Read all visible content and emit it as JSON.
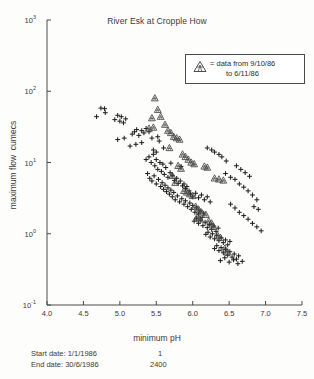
{
  "chart_data": {
    "type": "scatter",
    "title": "River Esk at Cropple How",
    "xlabel": "minimum pH",
    "ylabel": "maximum flow  cumecs",
    "xlim": [
      4.0,
      7.5
    ],
    "ylim": [
      0.1,
      1000
    ],
    "yscale": "log",
    "xscale": "linear",
    "grid": false,
    "xticks": [
      "4.0",
      "4.5",
      "5.0",
      "5.5",
      "6.0",
      "6.5",
      "7.0",
      "7.5"
    ],
    "xtick_values": [
      4.0,
      4.5,
      5.0,
      5.5,
      6.0,
      6.5,
      7.0,
      7.5
    ],
    "yticks": [
      "10",
      "10",
      "10",
      "10",
      "10"
    ],
    "ytick_exponents": [
      "3",
      "2",
      "1",
      "0",
      "-1"
    ],
    "ytick_values": [
      1000,
      100,
      10,
      1,
      0.1
    ],
    "legend": {
      "position": "upper-right-inset",
      "marker": "triangle",
      "line1": "= data from 9/10/86",
      "line2": "to 6/11/86"
    },
    "series": [
      {
        "name": "all data",
        "marker": "plus",
        "color": "#222222",
        "points": [
          [
            4.68,
            44
          ],
          [
            4.74,
            58
          ],
          [
            4.79,
            57
          ],
          [
            4.8,
            50
          ],
          [
            4.93,
            40
          ],
          [
            4.97,
            46
          ],
          [
            5.0,
            38
          ],
          [
            5.02,
            44
          ],
          [
            5.05,
            36
          ],
          [
            5.08,
            41
          ],
          [
            4.97,
            21
          ],
          [
            5.06,
            22
          ],
          [
            5.17,
            25
          ],
          [
            5.2,
            27
          ],
          [
            5.23,
            29
          ],
          [
            5.26,
            24
          ],
          [
            5.3,
            28
          ],
          [
            5.33,
            26
          ],
          [
            5.36,
            30
          ],
          [
            5.4,
            27
          ],
          [
            5.44,
            22
          ],
          [
            5.22,
            18
          ],
          [
            5.52,
            23
          ],
          [
            5.36,
            11
          ],
          [
            5.4,
            12
          ],
          [
            5.43,
            10
          ],
          [
            5.46,
            13
          ],
          [
            5.48,
            9.0
          ],
          [
            5.5,
            11
          ],
          [
            5.52,
            8.0
          ],
          [
            5.55,
            10
          ],
          [
            5.57,
            7.5
          ],
          [
            5.59,
            9.5
          ],
          [
            5.61,
            6.8
          ],
          [
            5.63,
            8.5
          ],
          [
            5.38,
            7.0
          ],
          [
            5.41,
            6.0
          ],
          [
            5.44,
            5.5
          ],
          [
            5.47,
            6.5
          ],
          [
            5.5,
            5.0
          ],
          [
            5.53,
            5.8
          ],
          [
            5.56,
            4.6
          ],
          [
            5.58,
            5.2
          ],
          [
            5.6,
            4.2
          ],
          [
            5.62,
            4.8
          ],
          [
            5.64,
            3.9
          ],
          [
            5.66,
            4.4
          ],
          [
            5.68,
            3.6
          ],
          [
            5.7,
            4.1
          ],
          [
            5.72,
            3.3
          ],
          [
            5.74,
            3.8
          ],
          [
            5.66,
            6.2
          ],
          [
            5.69,
            7.2
          ],
          [
            5.72,
            6.6
          ],
          [
            5.75,
            5.6
          ],
          [
            5.78,
            6.0
          ],
          [
            5.8,
            5.1
          ],
          [
            5.83,
            5.5
          ],
          [
            5.86,
            4.7
          ],
          [
            5.88,
            5.0
          ],
          [
            5.9,
            4.3
          ],
          [
            5.92,
            4.6
          ],
          [
            5.95,
            4.0
          ],
          [
            5.76,
            3.0
          ],
          [
            5.79,
            3.4
          ],
          [
            5.82,
            2.8
          ],
          [
            5.85,
            3.1
          ],
          [
            5.88,
            2.6
          ],
          [
            5.9,
            2.9
          ],
          [
            5.93,
            2.4
          ],
          [
            5.96,
            2.7
          ],
          [
            5.98,
            2.2
          ],
          [
            6.0,
            2.5
          ],
          [
            6.03,
            2.0
          ],
          [
            6.05,
            2.3
          ],
          [
            6.08,
            1.9
          ],
          [
            6.1,
            2.1
          ],
          [
            6.13,
            1.7
          ],
          [
            6.15,
            1.95
          ],
          [
            5.97,
            3.6
          ],
          [
            6.0,
            3.3
          ],
          [
            6.04,
            3.7
          ],
          [
            6.08,
            3.2
          ],
          [
            6.12,
            3.5
          ],
          [
            6.16,
            3.0
          ],
          [
            6.2,
            3.3
          ],
          [
            6.24,
            2.8
          ],
          [
            6.02,
            1.5
          ],
          [
            6.05,
            1.65
          ],
          [
            6.08,
            1.4
          ],
          [
            6.11,
            1.55
          ],
          [
            6.14,
            1.3
          ],
          [
            6.17,
            1.45
          ],
          [
            6.2,
            1.22
          ],
          [
            6.23,
            1.35
          ],
          [
            6.26,
            1.15
          ],
          [
            6.29,
            1.28
          ],
          [
            6.32,
            1.08
          ],
          [
            6.35,
            1.2
          ],
          [
            6.18,
            0.98
          ],
          [
            6.21,
            1.05
          ],
          [
            6.24,
            0.9
          ],
          [
            6.27,
            1.0
          ],
          [
            6.3,
            0.85
          ],
          [
            6.33,
            0.95
          ],
          [
            6.36,
            0.8
          ],
          [
            6.39,
            0.88
          ],
          [
            6.42,
            0.75
          ],
          [
            6.45,
            0.82
          ],
          [
            6.48,
            0.7
          ],
          [
            6.51,
            0.78
          ],
          [
            6.3,
            0.62
          ],
          [
            6.33,
            0.68
          ],
          [
            6.36,
            0.58
          ],
          [
            6.39,
            0.64
          ],
          [
            6.42,
            0.54
          ],
          [
            6.45,
            0.6
          ],
          [
            6.48,
            0.5
          ],
          [
            6.51,
            0.56
          ],
          [
            6.54,
            0.47
          ],
          [
            6.57,
            0.52
          ],
          [
            6.6,
            0.44
          ],
          [
            6.63,
            0.49
          ],
          [
            6.38,
            0.42
          ],
          [
            6.44,
            0.46
          ],
          [
            6.5,
            0.4
          ],
          [
            6.56,
            0.43
          ],
          [
            6.62,
            0.38
          ],
          [
            6.68,
            0.41
          ],
          [
            6.45,
            7.0
          ],
          [
            6.52,
            6.2
          ],
          [
            6.58,
            5.8
          ],
          [
            6.64,
            5.0
          ],
          [
            6.7,
            4.5
          ],
          [
            6.76,
            4.0
          ],
          [
            6.82,
            3.5
          ],
          [
            6.88,
            3.0
          ],
          [
            6.6,
            9.0
          ],
          [
            6.66,
            8.0
          ],
          [
            6.72,
            7.2
          ],
          [
            6.78,
            6.4
          ],
          [
            6.4,
            12
          ],
          [
            6.46,
            10.5
          ],
          [
            6.3,
            14
          ],
          [
            6.36,
            13
          ],
          [
            6.2,
            16
          ],
          [
            6.26,
            15
          ],
          [
            6.52,
            2.6
          ],
          [
            6.58,
            2.3
          ],
          [
            6.64,
            2.0
          ],
          [
            6.7,
            1.8
          ],
          [
            6.76,
            1.6
          ],
          [
            6.82,
            1.4
          ],
          [
            6.88,
            1.25
          ],
          [
            6.94,
            1.1
          ],
          [
            6.84,
            2.4
          ],
          [
            6.9,
            2.2
          ],
          [
            5.54,
            20
          ],
          [
            5.3,
            19
          ],
          [
            5.14,
            17
          ],
          [
            5.6,
            16
          ],
          [
            5.84,
            8.8
          ],
          [
            5.7,
            9.8
          ],
          [
            5.46,
            15
          ],
          [
            5.5,
            14
          ]
        ]
      },
      {
        "name": "data from 9/10/86 to 6/11/86",
        "marker": "triangle",
        "color": "#444444",
        "points": [
          [
            5.48,
            80
          ],
          [
            5.52,
            55
          ],
          [
            5.44,
            42
          ],
          [
            5.56,
            44
          ],
          [
            5.4,
            30
          ],
          [
            5.46,
            31
          ],
          [
            5.62,
            34
          ],
          [
            5.66,
            28
          ],
          [
            5.7,
            26
          ],
          [
            5.74,
            23
          ],
          [
            5.78,
            22
          ],
          [
            5.82,
            21
          ],
          [
            5.68,
            16
          ],
          [
            5.86,
            13
          ],
          [
            5.9,
            12
          ],
          [
            5.94,
            11
          ],
          [
            5.98,
            10
          ],
          [
            6.02,
            9.5
          ],
          [
            5.8,
            9.0
          ],
          [
            5.84,
            8.2
          ],
          [
            6.16,
            8.8
          ],
          [
            6.2,
            8.5
          ],
          [
            6.3,
            6.0
          ],
          [
            6.36,
            5.8
          ],
          [
            6.42,
            5.6
          ],
          [
            5.88,
            4.0
          ],
          [
            5.92,
            3.8
          ],
          [
            5.96,
            3.6
          ],
          [
            6.0,
            3.4
          ],
          [
            6.04,
            2.4
          ],
          [
            6.08,
            2.2
          ],
          [
            6.12,
            2.0
          ],
          [
            6.22,
            1.5
          ],
          [
            6.26,
            1.4
          ],
          [
            6.34,
            0.95
          ],
          [
            6.38,
            0.88
          ],
          [
            6.44,
            0.62
          ],
          [
            6.06,
            1.7
          ],
          [
            6.1,
            1.6
          ],
          [
            5.76,
            5.2
          ],
          [
            5.72,
            6.5
          ],
          [
            6.18,
            1.85
          ],
          [
            6.28,
            1.25
          ],
          [
            6.48,
            0.55
          ]
        ]
      }
    ]
  },
  "footer": {
    "start_label": "Start date:",
    "start_date": "1/1/1986",
    "start_value": "1",
    "end_label": "End date:",
    "end_date": "30/6/1986",
    "end_value": "2400"
  }
}
